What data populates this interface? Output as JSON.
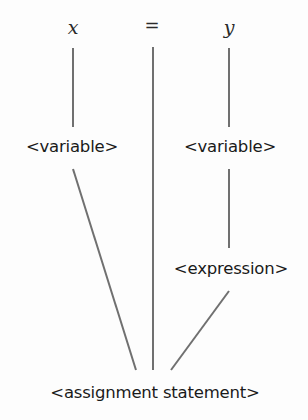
{
  "diagram": {
    "type": "parse-tree",
    "terminals": [
      {
        "id": "x",
        "label": "x"
      },
      {
        "id": "eq",
        "label": "="
      },
      {
        "id": "y",
        "label": "y"
      }
    ],
    "nonterminals": [
      {
        "id": "var_left",
        "label": "<variable>"
      },
      {
        "id": "var_right",
        "label": "<variable>"
      },
      {
        "id": "expression",
        "label": "<expression>"
      },
      {
        "id": "assignment",
        "label": "<assignment statement>"
      }
    ],
    "edges": [
      {
        "from": "x",
        "to": "var_left"
      },
      {
        "from": "y",
        "to": "var_right"
      },
      {
        "from": "var_right",
        "to": "expression"
      },
      {
        "from": "var_left",
        "to": "assignment"
      },
      {
        "from": "eq",
        "to": "assignment"
      },
      {
        "from": "expression",
        "to": "assignment"
      }
    ],
    "colors": {
      "line": "#707070",
      "text": "#1a1a1a",
      "background": "#fdfdfd"
    }
  }
}
